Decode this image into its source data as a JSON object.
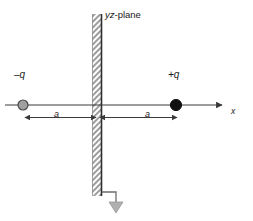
{
  "figure": {
    "background_color": "#ffffff",
    "line_color": "#3a3a3a",
    "ground_color": "#9a9a9a",
    "plane_fill_color": "#a8a8a8"
  },
  "plane": {
    "label_italic": "yz",
    "label_rest": "-plane",
    "label_full": "yz-plane"
  },
  "charges": [
    {
      "id": "negative-charge",
      "label": "–q",
      "sign": "negative",
      "fill_color": "#a0a0a0",
      "stroke_color": "#4a4a4a",
      "x": -1,
      "radius": 5
    },
    {
      "id": "positive-charge",
      "label": "+q",
      "sign": "positive",
      "fill_color": "#111111",
      "stroke_color": "#111111",
      "x": 1,
      "radius": 5.5
    }
  ],
  "axis": {
    "label": "x",
    "direction": "right"
  },
  "dimensions": [
    {
      "id": "distance-left",
      "label": "a",
      "from": "negative-charge",
      "to": "plane"
    },
    {
      "id": "distance-right",
      "label": "a",
      "from": "plane",
      "to": "positive-charge"
    }
  ],
  "ground": {
    "label": "",
    "symbol": "ground-arrow"
  }
}
